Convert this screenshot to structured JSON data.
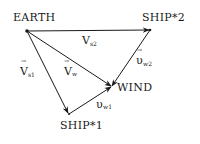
{
  "diagram": {
    "nodes": [
      {
        "id": "earth",
        "label": "EARTH"
      },
      {
        "id": "ship2",
        "label": "SHIP*2"
      },
      {
        "id": "wind",
        "label": "WIND"
      },
      {
        "id": "ship1",
        "label": "SHIP*1"
      }
    ],
    "edges": [
      {
        "id": "vs2",
        "from": "earth",
        "to": "ship2",
        "symbol": "V",
        "subscript": "s2",
        "vector_arrow": "→"
      },
      {
        "id": "vs1",
        "from": "earth",
        "to": "ship1",
        "symbol": "V",
        "subscript": "s1",
        "vector_arrow": "→"
      },
      {
        "id": "vw",
        "from": "earth",
        "to": "wind",
        "symbol": "V",
        "subscript": "w",
        "vector_arrow": "→"
      },
      {
        "id": "vw1",
        "from": "ship1",
        "to": "wind",
        "symbol": "υ",
        "subscript": "w1",
        "vector_arrow": ""
      },
      {
        "id": "vw2",
        "from": "ship2",
        "to": "wind",
        "symbol": "υ",
        "subscript": "w2",
        "vector_arrow": "→"
      }
    ]
  }
}
